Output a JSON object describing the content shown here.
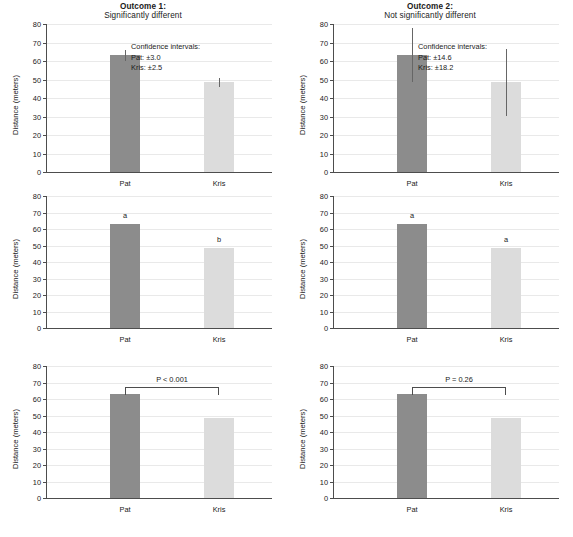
{
  "figure": {
    "width": 573,
    "height": 537,
    "colors": {
      "bar_pat": "#8c8c8c",
      "bar_kris": "#dcdcdc",
      "axis": "#4d4d4d",
      "grid": "#e9e9e9",
      "text": "#1a1a1a",
      "error_bar": "#666666"
    }
  },
  "chart_data": {
    "type": "bar",
    "xlabel": "",
    "ylabel": "Distance (meters)",
    "ylim": [
      0,
      80
    ],
    "yticks": [
      0,
      10,
      20,
      30,
      40,
      50,
      60,
      70,
      80
    ],
    "grid": true,
    "legend": "none",
    "categories": [
      "Pat",
      "Kris"
    ],
    "values": [
      63,
      48.5
    ],
    "columns": [
      {
        "id": "outcome-1",
        "title_line1": "Outcome 1:",
        "title_line2": "Significantly different"
      },
      {
        "id": "outcome-2",
        "title_line1": "Outcome 2:",
        "title_line2": "Not significantly different"
      }
    ],
    "panels": [
      {
        "id": "panel-1-error-bars",
        "row": 1,
        "column": "outcome-1",
        "style": "error-bars",
        "categories": [
          "Pat",
          "Kris"
        ],
        "values": [
          63,
          48.5
        ],
        "errors": [
          3.0,
          2.5
        ],
        "annotation_title": "Confidence intervals:",
        "annotation_lines": [
          "Pat: ±3.0",
          "Kris: ±2.5"
        ]
      },
      {
        "id": "panel-2-error-bars",
        "row": 1,
        "column": "outcome-2",
        "style": "error-bars",
        "categories": [
          "Pat",
          "Kris"
        ],
        "values": [
          63,
          48.5
        ],
        "errors": [
          14.6,
          18.2
        ],
        "annotation_title": "Confidence intervals:",
        "annotation_lines": [
          "Pat: ±14.6",
          "Kris: ±18.2"
        ]
      },
      {
        "id": "panel-3-letters",
        "row": 2,
        "column": "outcome-1",
        "style": "letters",
        "categories": [
          "Pat",
          "Kris"
        ],
        "values": [
          63,
          48.5
        ],
        "letters": [
          "a",
          "b"
        ]
      },
      {
        "id": "panel-4-letters",
        "row": 2,
        "column": "outcome-2",
        "style": "letters",
        "categories": [
          "Pat",
          "Kris"
        ],
        "values": [
          63,
          48.5
        ],
        "letters": [
          "a",
          "a"
        ]
      },
      {
        "id": "panel-5-pvalue",
        "row": 3,
        "column": "outcome-1",
        "style": "p-value-bracket",
        "categories": [
          "Pat",
          "Kris"
        ],
        "values": [
          63,
          48.5
        ],
        "bracket_label": "P < 0.001"
      },
      {
        "id": "panel-6-pvalue",
        "row": 3,
        "column": "outcome-2",
        "style": "p-value-bracket",
        "categories": [
          "Pat",
          "Kris"
        ],
        "values": [
          63,
          48.5
        ],
        "bracket_label": "P = 0.26"
      }
    ]
  }
}
